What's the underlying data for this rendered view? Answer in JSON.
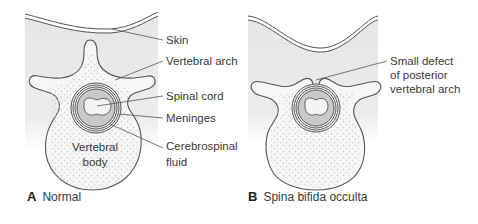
{
  "panels": [
    {
      "id": "A",
      "caption_letter": "A",
      "caption_text": "Normal",
      "labels": {
        "skin": "Skin",
        "vertebral_arch": "Vertebral arch",
        "spinal_cord": "Spinal cord",
        "meninges": "Meninges",
        "csf_line1": "Cerebrospinal",
        "csf_line2": "fluid",
        "body_line1": "Vertebral",
        "body_line2": "body"
      }
    },
    {
      "id": "B",
      "caption_letter": "B",
      "caption_text": "Spina bifida occulta",
      "labels": {
        "defect_line1": "Small defect",
        "defect_line2": "of posterior",
        "defect_line3": "vertebral arch"
      }
    }
  ],
  "colors": {
    "tissue": "#e9e9e9",
    "bone": "#f7f7f7",
    "outline": "#555555",
    "canal_fill": "#c9c9c9",
    "leader": "#555555"
  }
}
